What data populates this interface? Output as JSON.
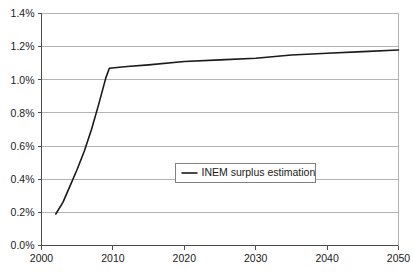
{
  "chart_data": {
    "type": "line",
    "title": "",
    "subtitle": "",
    "xlabel": "",
    "ylabel": "",
    "xlim": [
      2000,
      2050
    ],
    "ylim": [
      0.0,
      1.4
    ],
    "y_tick_labels": [
      "0.0%",
      "0.2%",
      "0.4%",
      "0.6%",
      "0.8%",
      "1.0%",
      "1.2%",
      "1.4%"
    ],
    "y_tick_values": [
      0.0,
      0.2,
      0.4,
      0.6,
      0.8,
      1.0,
      1.2,
      1.4
    ],
    "x_tick_labels": [
      "2000",
      "2010",
      "2020",
      "2030",
      "2040",
      "2050"
    ],
    "x_tick_values": [
      2000,
      2010,
      2020,
      2030,
      2040,
      2050
    ],
    "grid": {
      "horizontal": true,
      "vertical": false,
      "color": "#b3b3b3"
    },
    "axis_color": "#4d4d4d",
    "plot_background": "#ffffff",
    "legend": {
      "position": "center",
      "border_color": "#808080",
      "background": "#ffffff",
      "entries": [
        {
          "label": "INEM surplus estimation",
          "color": "#1a1a1a",
          "marker": "line"
        }
      ]
    },
    "series": [
      {
        "name": "INEM surplus estimation",
        "color": "#1a1a1a",
        "line_width": 1.6,
        "x": [
          2002.0,
          2003.0,
          2004.0,
          2005.0,
          2006.0,
          2007.0,
          2008.0,
          2009.0,
          2009.5,
          2012.0,
          2015.0,
          2020.0,
          2025.0,
          2030.0,
          2035.0,
          2040.0,
          2045.0,
          2050.0
        ],
        "y": [
          0.19,
          0.26,
          0.36,
          0.46,
          0.57,
          0.7,
          0.85,
          1.01,
          1.07,
          1.08,
          1.09,
          1.11,
          1.12,
          1.13,
          1.15,
          1.16,
          1.17,
          1.18
        ]
      }
    ]
  }
}
